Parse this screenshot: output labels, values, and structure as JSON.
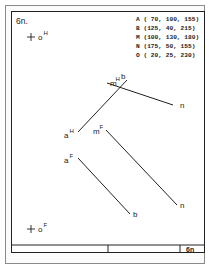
{
  "sheet": {
    "number_label": "6n.",
    "title_block_label": "6n"
  },
  "coordinates": [
    {
      "point": "A",
      "text": "A ( 70, 100, 155)"
    },
    {
      "point": "B",
      "text": "B (125,  40, 215)"
    },
    {
      "point": "M",
      "text": "M (100, 130, 180)"
    },
    {
      "point": "N",
      "text": "N (175,  50, 155)"
    },
    {
      "point": "O",
      "text": "O ( 20,  25, 230)"
    }
  ],
  "origin_labels": {
    "horizontal": {
      "base": "o",
      "sup": "H"
    },
    "frontal": {
      "base": "o",
      "sup": "F"
    }
  },
  "horizontal_projection": {
    "line_ab": {
      "start_label": {
        "base": "a",
        "sup": "H"
      },
      "end_label": {
        "base": "b",
        "sup": ""
      }
    },
    "line_mn": {
      "start_label": {
        "base": "m",
        "sup": "H"
      },
      "end_label": {
        "base": "n",
        "sup": ""
      }
    }
  },
  "frontal_projection": {
    "line_ab": {
      "start_label": {
        "base": "a",
        "sup": "F"
      },
      "end_label": {
        "base": "b",
        "sup": ""
      }
    },
    "line_mn": {
      "start_label": {
        "base": "m",
        "sup": "F"
      },
      "end_label": {
        "base": "n",
        "sup": ""
      }
    }
  },
  "colors": {
    "ink": "#222222",
    "paper": "#ffffff",
    "outer_border": "#8a8a8a"
  }
}
